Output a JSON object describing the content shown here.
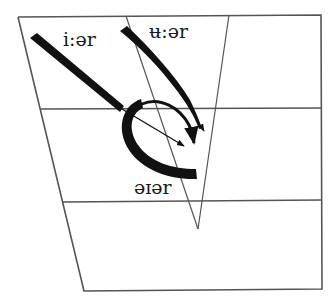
{
  "diagram": {
    "colors": {
      "line": "#555555",
      "stroke": "#111111",
      "background": "#ffffff"
    },
    "labels": {
      "iar": "i:ər",
      "uar": "ʉ:ər",
      "eiar": "əɪər"
    },
    "glides": [
      {
        "name": "i:ər",
        "from": "close front",
        "to": "centre (mid)",
        "style": "thick-to-thin with arrowhead"
      },
      {
        "name": "ʉ:ər",
        "from": "close central",
        "to": "centre (mid)",
        "style": "thick-to-thin with arrowhead"
      },
      {
        "name": "əɪər",
        "from": "open-mid central",
        "to": "centre (mid)",
        "style": "thick curved hook with two arrowheads"
      }
    ]
  }
}
